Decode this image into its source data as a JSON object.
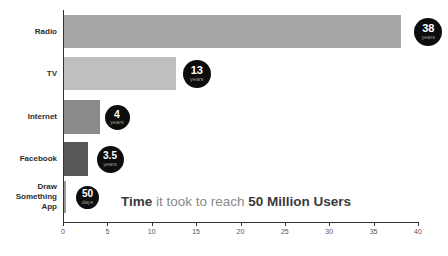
{
  "title": {
    "part1": "Time",
    "part2": " it took to reach ",
    "part3": "50 Million Users"
  },
  "chart_data": {
    "type": "bar",
    "orientation": "horizontal",
    "title": "Time it took to reach 50 Million Users",
    "categories": [
      "Radio",
      "TV",
      "Internet",
      "Facebook",
      "Draw Something App"
    ],
    "values_years": [
      38,
      13,
      4,
      3.5,
      0.14
    ],
    "bar_lengths_axis_units": [
      38,
      12.6,
      4,
      2.65,
      0.2
    ],
    "value_labels": [
      {
        "number": "38",
        "unit": "years"
      },
      {
        "number": "13",
        "unit": "years"
      },
      {
        "number": "4",
        "unit": "years"
      },
      {
        "number": "3.5",
        "unit": "years"
      },
      {
        "number": "50",
        "unit": "days"
      }
    ],
    "bar_colors": [
      "#a7a7a7",
      "#bfbfbf",
      "#8b8b8b",
      "#585858",
      "#999999"
    ],
    "badge_color": "#0d0d0d",
    "badge_number_color": "#ffffff",
    "badge_unit_color": "#9e9e9e",
    "xlim": [
      0,
      40
    ],
    "x_ticks": [
      "0",
      "5",
      "10",
      "15",
      "20",
      "25",
      "30",
      "35",
      "40"
    ],
    "grid": false,
    "legend": false
  }
}
